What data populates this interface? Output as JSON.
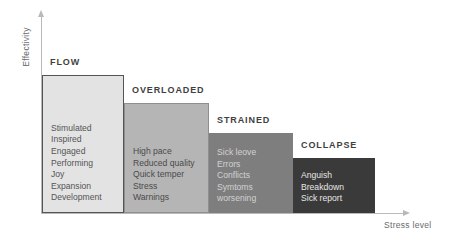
{
  "chart_data": {
    "type": "bar",
    "title": "",
    "xlabel": "Stress level",
    "ylabel": "Effectivity",
    "grid": false,
    "legend": "none",
    "orientation": "descending-step",
    "categories": [
      "FLOW",
      "OVERLOADED",
      "STRAINED",
      "COLLAPSE"
    ],
    "values": [
      4,
      3,
      2,
      1
    ],
    "series": [
      {
        "name": "Effectivity by stress level",
        "values": [
          4,
          3,
          2,
          1
        ]
      }
    ],
    "stages": [
      {
        "label": "FLOW",
        "value": 4,
        "color": "#e3e3e3",
        "text_color": "#555555",
        "items": [
          "Stimulated",
          "Inspired",
          "Engaged",
          "Performing",
          "Joy",
          "Expansion",
          "Development"
        ]
      },
      {
        "label": "OVERLOADED",
        "value": 3,
        "color": "#b5b5b5",
        "text_color": "#4a4a4a",
        "items": [
          "High pace",
          "Reduced quality",
          "Quick temper",
          "Stress",
          "Warnings"
        ]
      },
      {
        "label": "STRAINED",
        "value": 2,
        "color": "#7e7e7e",
        "text_color": "#d2d2d2",
        "items": [
          "Sick leove",
          "Errors",
          "Conflicts",
          "Symtoms",
          "worsening"
        ]
      },
      {
        "label": "COLLAPSE",
        "value": 1,
        "color": "#3a3a3a",
        "text_color": "#e6e6e6",
        "items": [
          "Anguish",
          "Breakdown",
          "Sick report"
        ]
      }
    ]
  },
  "axes": {
    "y_label": "Effectivity",
    "x_label": "Stress level",
    "axis_color": "#b9b9b9"
  }
}
